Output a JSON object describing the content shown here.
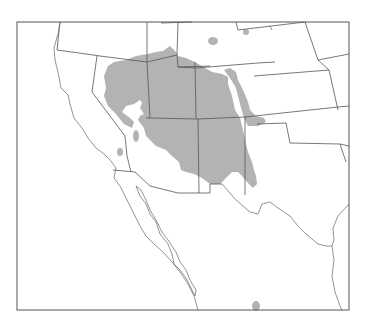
{
  "map": {
    "type": "species range map",
    "region": "Southwestern United States and northern Mexico",
    "frame": {
      "x": 17,
      "y": 22,
      "w": 332,
      "h": 288
    },
    "colors": {
      "range_fill": "#b3b3b3",
      "lines": "#555555",
      "background": "#ffffff"
    },
    "range_polygons": [
      [
        [
          163,
          51
        ],
        [
          170,
          46
        ],
        [
          176,
          52
        ],
        [
          178,
          56
        ],
        [
          186,
          58
        ],
        [
          195,
          62
        ],
        [
          205,
          68
        ],
        [
          212,
          72
        ],
        [
          222,
          74
        ],
        [
          228,
          77
        ],
        [
          228,
          84
        ],
        [
          232,
          96
        ],
        [
          235,
          110
        ],
        [
          240,
          118
        ],
        [
          242,
          126
        ],
        [
          244,
          134
        ],
        [
          246,
          144
        ],
        [
          248,
          152
        ],
        [
          252,
          162
        ],
        [
          254,
          170
        ],
        [
          256,
          176
        ],
        [
          257,
          184
        ],
        [
          253,
          188
        ],
        [
          247,
          182
        ],
        [
          242,
          176
        ],
        [
          238,
          172
        ],
        [
          232,
          172
        ],
        [
          226,
          178
        ],
        [
          220,
          184
        ],
        [
          210,
          184
        ],
        [
          202,
          178
        ],
        [
          194,
          174
        ],
        [
          186,
          172
        ],
        [
          181,
          170
        ],
        [
          179,
          162
        ],
        [
          172,
          156
        ],
        [
          166,
          150
        ],
        [
          156,
          146
        ],
        [
          150,
          140
        ],
        [
          146,
          136
        ],
        [
          144,
          128
        ],
        [
          138,
          120
        ],
        [
          140,
          116
        ],
        [
          144,
          114
        ],
        [
          140,
          108
        ],
        [
          142,
          103
        ],
        [
          140,
          100
        ],
        [
          134,
          104
        ],
        [
          126,
          106
        ],
        [
          122,
          112
        ],
        [
          130,
          118
        ],
        [
          134,
          122
        ],
        [
          132,
          128
        ],
        [
          124,
          124
        ],
        [
          116,
          114
        ],
        [
          108,
          106
        ],
        [
          104,
          96
        ],
        [
          106,
          88
        ],
        [
          104,
          76
        ],
        [
          108,
          66
        ],
        [
          114,
          62
        ],
        [
          126,
          60
        ],
        [
          136,
          56
        ],
        [
          148,
          54
        ],
        [
          156,
          52
        ]
      ],
      [
        [
          224,
          70
        ],
        [
          230,
          68
        ],
        [
          236,
          72
        ],
        [
          238,
          80
        ],
        [
          244,
          92
        ],
        [
          248,
          102
        ],
        [
          250,
          110
        ],
        [
          256,
          116
        ],
        [
          264,
          118
        ],
        [
          266,
          122
        ],
        [
          258,
          126
        ],
        [
          248,
          126
        ],
        [
          244,
          118
        ],
        [
          240,
          104
        ],
        [
          236,
          88
        ],
        [
          230,
          78
        ]
      ]
    ],
    "range_spots": [
      {
        "cx": 213,
        "cy": 41,
        "rx": 5,
        "ry": 4
      },
      {
        "cx": 246,
        "cy": 32,
        "rx": 3,
        "ry": 3
      },
      {
        "cx": 120,
        "cy": 152,
        "rx": 3,
        "ry": 4
      },
      {
        "cx": 136,
        "cy": 136,
        "rx": 3,
        "ry": 6
      },
      {
        "cx": 256,
        "cy": 306,
        "rx": 4,
        "ry": 5
      }
    ],
    "state_borders": [
      "M60,22 L57,50 L79,53",
      "M79,53 L100,56 L147,62 L147,22",
      "M147,62 L177,55 L178,22",
      "M97,56 L92,92 L125,136",
      "M147,62 L150,118 L146,118",
      "M150,118 L198,119 L245,117",
      "M195,62 L196,119",
      "M177,55 L178,67 L196,68",
      "M196,68 L258,63",
      "M258,63 L275,62",
      "M245,117 L245,195",
      "M178,67 L210,66",
      "M198,119 L199,193",
      "M161,23 L192,22",
      "M236,22 L238,30",
      "M238,30 L305,22",
      "M305,22 L318,60 L329,70",
      "M318,60 L349,54",
      "M254,76 L329,70",
      "M329,70 L338,110",
      "M245,117 L338,107",
      "M338,107 L349,106",
      "M257,124 L286,123 L290,143 L340,144",
      "M340,144 L349,146",
      "M340,144 L346,162",
      "M113,170 L135,172",
      "M125,136 L127,156 L131,172",
      "M135,172 L150,186 L178,193 L199,193",
      "M199,193 L210,193 L210,184 L222,184"
    ],
    "coastlines": [
      "M60,22 L58,34 L54,48 L55,60 L58,72 L61,88 L68,95 L70,104 L74,118 L82,128 L88,138 L96,148 L104,154 L110,160 L116,168 L114,178 L120,186 L127,200 L134,214 L140,226 L146,236 L154,244 L163,252 L172,262 L180,272 L188,284 L194,296 L198,310",
      "M136,186 L140,196 L146,204 L150,214 L156,222 L160,234 L168,244 L172,254 L174,264 L180,270 L186,278 L190,286 L195,296 L196,290 L190,280 L186,270 L180,262 L176,252 L168,240 L162,232 L156,220 L150,210 L146,200 L141,190 Z",
      "M222,184 L236,200 L250,212 L258,214 L262,204 L270,202 L278,208 L290,216 L298,226 L306,234 L318,244 L326,246 L332,246 L334,240 L333,228 L338,216 L349,204",
      "M332,246 L334,260 L332,276 L335,292 L340,306 L342,310",
      "M270,26 L272,30"
    ],
    "top_cut_text": [
      {
        "text": "p",
        "x": 70
      },
      {
        "text": "p",
        "x": 239
      }
    ]
  }
}
